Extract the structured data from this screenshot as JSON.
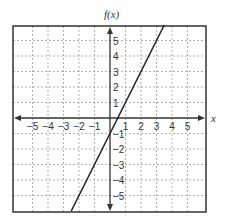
{
  "chart_data": {
    "type": "line",
    "title": "",
    "xlabel": "x",
    "ylabel": "f(x)",
    "xlim": [
      -6,
      6
    ],
    "ylim": [
      -6,
      6
    ],
    "grid": true,
    "x_ticks": [
      "-5",
      "-4",
      "-3",
      "-2",
      "-1",
      "1",
      "2",
      "3",
      "4",
      "5"
    ],
    "y_ticks": [
      "5",
      "4",
      "3",
      "2",
      "1",
      "-1",
      "-2",
      "-3",
      "-4",
      "-5"
    ],
    "series": [
      {
        "name": "f(x)",
        "equation": "f(x) = 2x - 1",
        "slope": 2,
        "intercept": -1,
        "x": [
          -2.5,
          0,
          0.5,
          1,
          3.5
        ],
        "values": [
          -6,
          -1,
          0,
          1,
          6
        ]
      }
    ],
    "colors": {
      "line": "#222222",
      "grid": "#999999",
      "frame": "#333333"
    }
  }
}
